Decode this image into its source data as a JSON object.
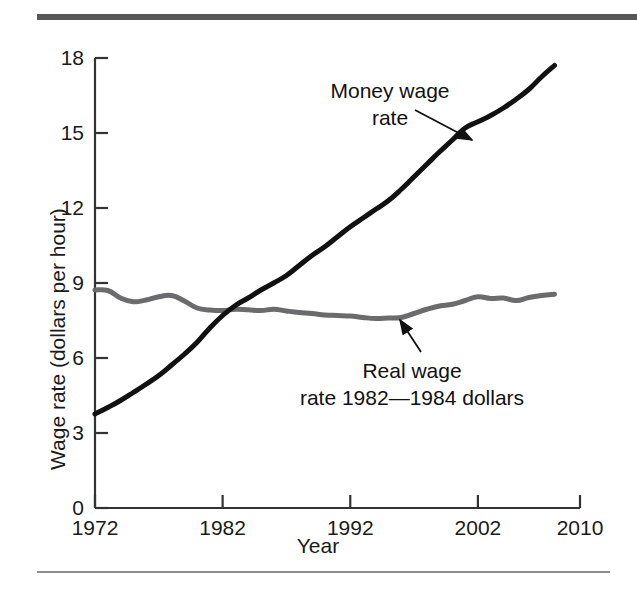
{
  "figure": {
    "background_color": "#ffffff",
    "rule_top_color": "#58585a",
    "rule_bottom_color": "#8c8c8e"
  },
  "chart_data": {
    "type": "line",
    "title": "",
    "xlabel": "Year",
    "ylabel": "Wage rate (dollars per hour)",
    "xlim": [
      1972,
      2010
    ],
    "ylim": [
      0,
      18
    ],
    "xticks": [
      "1972",
      "1982",
      "1992",
      "2002",
      "2010"
    ],
    "yticks": [
      "0",
      "3",
      "6",
      "9",
      "12",
      "15",
      "18"
    ],
    "grid": false,
    "legend": "annotations",
    "annotations": [
      {
        "name": "money-wage-rate",
        "line1": "Money wage",
        "line2": "rate",
        "color": "#111111",
        "points_to_x": 2000,
        "points_to_y": 14.6
      },
      {
        "name": "real-wage-rate",
        "line1": "Real wage",
        "line2": "rate 1982—1984 dollars",
        "color": "#111111",
        "points_to_x": 1995,
        "points_to_y": 7.7
      }
    ],
    "series": [
      {
        "name": "Money wage rate",
        "color": "#111111",
        "width": 5,
        "x": [
          1972,
          1973,
          1974,
          1975,
          1976,
          1977,
          1978,
          1979,
          1980,
          1981,
          1982,
          1983,
          1984,
          1985,
          1986,
          1987,
          1988,
          1989,
          1990,
          1991,
          1992,
          1993,
          1994,
          1995,
          1996,
          1997,
          1998,
          1999,
          2000,
          2001,
          2002,
          2003,
          2004,
          2005,
          2006,
          2007,
          2008
        ],
        "y": [
          3.76,
          4.02,
          4.3,
          4.62,
          4.95,
          5.3,
          5.72,
          6.15,
          6.63,
          7.2,
          7.7,
          8.1,
          8.4,
          8.72,
          9.0,
          9.3,
          9.7,
          10.1,
          10.45,
          10.85,
          11.25,
          11.6,
          11.95,
          12.3,
          12.75,
          13.25,
          13.75,
          14.25,
          14.72,
          15.2,
          15.45,
          15.7,
          16.0,
          16.35,
          16.75,
          17.25,
          17.7
        ]
      },
      {
        "name": "Real wage rate (1982—1984 dollars)",
        "color": "#6b6b6d",
        "width": 5,
        "x": [
          1972,
          1973,
          1974,
          1975,
          1976,
          1977,
          1978,
          1979,
          1980,
          1981,
          1982,
          1983,
          1984,
          1985,
          1986,
          1987,
          1988,
          1989,
          1990,
          1991,
          1992,
          1993,
          1994,
          1995,
          1996,
          1997,
          1998,
          1999,
          2000,
          2001,
          2002,
          2003,
          2004,
          2005,
          2006,
          2007,
          2008
        ],
        "y": [
          8.72,
          8.7,
          8.4,
          8.25,
          8.32,
          8.45,
          8.5,
          8.28,
          8.0,
          7.92,
          7.9,
          7.95,
          7.93,
          7.9,
          7.95,
          7.88,
          7.82,
          7.78,
          7.72,
          7.7,
          7.68,
          7.62,
          7.58,
          7.6,
          7.62,
          7.78,
          7.95,
          8.08,
          8.15,
          8.3,
          8.45,
          8.38,
          8.4,
          8.3,
          8.42,
          8.5,
          8.55
        ]
      }
    ]
  },
  "axes": {
    "axis_color": "#333333",
    "tick_color": "#333333"
  }
}
